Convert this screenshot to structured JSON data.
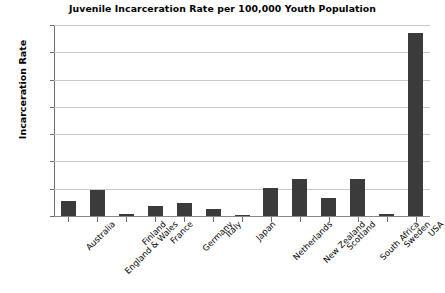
{
  "chart_data": {
    "type": "bar",
    "title": "Juvenile Incarceration Rate per 100,000 Youth Population",
    "xlabel": "",
    "ylabel": "Incarceration Rate",
    "categories": [
      "Australia",
      "England & Wales",
      "Finland",
      "France",
      "Germany",
      "Italy",
      "Japan",
      "Netherlands",
      "New Zealand",
      "Scotland",
      "South Africa",
      "Sweden",
      "USA"
    ],
    "values": [
      27,
      48,
      4,
      19,
      24,
      12,
      1,
      51,
      68,
      33,
      68,
      4,
      336
    ],
    "ylim": [
      0,
      350
    ],
    "yticks": [
      0,
      50,
      100,
      150,
      200,
      250,
      300,
      350
    ],
    "ytick_labels": [
      "0",
      "50",
      "100",
      "150",
      "200",
      "250",
      "300",
      "350"
    ],
    "grid": true,
    "legend": false,
    "bar_color": "#3b3b3b",
    "grid_color": "#c8c8c8",
    "axis_color": "#6e6e6e",
    "background_color": "#ffffff"
  }
}
